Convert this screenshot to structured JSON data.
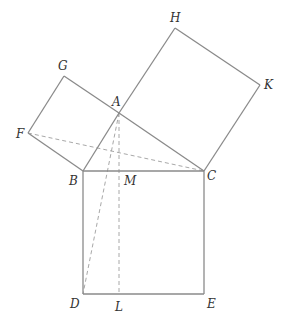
{
  "diagram": {
    "title": "",
    "points": {
      "A": {
        "label": "A",
        "x": 119,
        "y": 113,
        "lx": 112,
        "ly": 106
      },
      "B": {
        "label": "B",
        "x": 83,
        "y": 171,
        "lx": 69,
        "ly": 185
      },
      "C": {
        "label": "C",
        "x": 204,
        "y": 171,
        "lx": 207,
        "ly": 180
      },
      "D": {
        "label": "D",
        "x": 83,
        "y": 294,
        "lx": 70,
        "ly": 308
      },
      "E": {
        "label": "E",
        "x": 204,
        "y": 294,
        "lx": 207,
        "ly": 308
      },
      "F": {
        "label": "F",
        "x": 28,
        "y": 133,
        "lx": 16,
        "ly": 138
      },
      "G": {
        "label": "G",
        "x": 64,
        "y": 76,
        "lx": 58,
        "ly": 70
      },
      "H": {
        "label": "H",
        "x": 175,
        "y": 28,
        "lx": 170,
        "ly": 22
      },
      "K": {
        "label": "K",
        "x": 260,
        "y": 85,
        "lx": 264,
        "ly": 89
      },
      "L": {
        "label": "L",
        "x": 119,
        "y": 294,
        "lx": 115,
        "ly": 311
      },
      "M": {
        "label": "M",
        "x": 119,
        "y": 171,
        "lx": 124,
        "ly": 185
      }
    },
    "solid_segments": [
      [
        "F",
        "G"
      ],
      [
        "G",
        "A"
      ],
      [
        "A",
        "B"
      ],
      [
        "B",
        "F"
      ],
      [
        "A",
        "H"
      ],
      [
        "H",
        "K"
      ],
      [
        "K",
        "C"
      ],
      [
        "C",
        "A"
      ],
      [
        "B",
        "C"
      ],
      [
        "C",
        "E"
      ],
      [
        "E",
        "D"
      ],
      [
        "D",
        "B"
      ]
    ],
    "dashed_segments": [
      [
        "F",
        "C"
      ],
      [
        "A",
        "D"
      ],
      [
        "A",
        "L"
      ]
    ],
    "colors": {
      "solid": "#8a8a8a",
      "dashed": "#a8a8a8",
      "label": "#333333"
    }
  }
}
